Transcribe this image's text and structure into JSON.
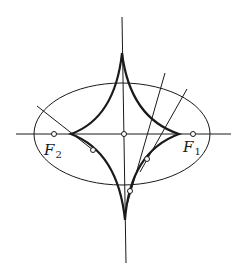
{
  "figure": {
    "labels": {
      "focus_right": {
        "main": "F",
        "subscript": "1"
      },
      "focus_left": {
        "main": "F",
        "subscript": "2"
      }
    },
    "elements": [
      "ellipse",
      "evolute-curve",
      "horizontal-axis",
      "vertical-axis",
      "focus-F1",
      "focus-F2",
      "center-point",
      "normal-lines"
    ]
  }
}
